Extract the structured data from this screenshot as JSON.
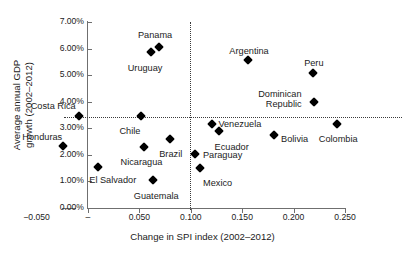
{
  "chart_data": {
    "type": "scatter",
    "title": "",
    "xlabel": "Change in SPI index (2002–2012)",
    "ylabel_line1": "Average annual GDP",
    "ylabel_line2": "growth (2002–2012)",
    "xlim": [
      -0.05,
      0.25
    ],
    "ylim": [
      0.0,
      7.0
    ],
    "grid": false,
    "legend": "none",
    "marker_style": "filled-diamond",
    "marker_color": "#000000",
    "xticks": [
      {
        "value": -0.05,
        "label": "−0.050"
      },
      {
        "value": 0.0,
        "label": "–"
      },
      {
        "value": 0.05,
        "label": "0.050"
      },
      {
        "value": 0.1,
        "label": "0.100"
      },
      {
        "value": 0.15,
        "label": "0.150"
      },
      {
        "value": 0.2,
        "label": "0.200"
      },
      {
        "value": 0.25,
        "label": "0.250"
      }
    ],
    "yticks": [
      {
        "value": 0.0,
        "label": "0.00%"
      },
      {
        "value": 1.0,
        "label": "1.00%"
      },
      {
        "value": 2.0,
        "label": "2.00%"
      },
      {
        "value": 3.0,
        "label": "3.00%"
      },
      {
        "value": 4.0,
        "label": "4.00%"
      },
      {
        "value": 5.0,
        "label": "5.00%"
      },
      {
        "value": 6.0,
        "label": "6.00%"
      },
      {
        "value": 7.0,
        "label": "7.00%"
      }
    ],
    "reference_lines": [
      {
        "orientation": "horizontal",
        "value": 3.42,
        "style": "dotted"
      },
      {
        "orientation": "vertical",
        "value": 0.099,
        "style": "dotted"
      }
    ],
    "points": [
      {
        "label": "Honduras",
        "x": -0.024,
        "y": 2.33,
        "label_dx": -41,
        "label_dy": -14
      },
      {
        "label": "Costa Rica",
        "x": -0.009,
        "y": 3.46,
        "label_dx": -48,
        "label_dy": -15
      },
      {
        "label": "El Salvador",
        "x": 0.01,
        "y": 1.54,
        "label_dx": -9,
        "label_dy": 8
      },
      {
        "label": "Chile",
        "x": 0.052,
        "y": 3.46,
        "label_dx": -22,
        "label_dy": 10
      },
      {
        "label": "Nicaragua",
        "x": 0.054,
        "y": 2.3,
        "label_dx": -23,
        "label_dy": 10
      },
      {
        "label": "Uruguay",
        "x": 0.061,
        "y": 5.87,
        "label_dx": -23,
        "label_dy": 11
      },
      {
        "label": "Guatemala",
        "x": 0.063,
        "y": 1.05,
        "label_dx": -19,
        "label_dy": 11
      },
      {
        "label": "Panama",
        "x": 0.069,
        "y": 6.06,
        "label_dx": -21,
        "label_dy": -17
      },
      {
        "label": "Brazil",
        "x": 0.08,
        "y": 2.6,
        "label_dx": -11,
        "label_dy": 10
      },
      {
        "label": "Paraguay",
        "x": 0.104,
        "y": 2.03,
        "label_dx": 8,
        "label_dy": -4
      },
      {
        "label": "Mexico",
        "x": 0.109,
        "y": 1.51,
        "label_dx": 3,
        "label_dy": 10
      },
      {
        "label": "Venezuela",
        "x": 0.121,
        "y": 3.16,
        "label_dx": 6,
        "label_dy": -5
      },
      {
        "label": "Ecuador",
        "x": 0.127,
        "y": 2.9,
        "label_dx": -4,
        "label_dy": 11
      },
      {
        "label": "Argentina",
        "x": 0.156,
        "y": 5.57,
        "label_dx": -19,
        "label_dy": -14
      },
      {
        "label": "Bolivia",
        "x": 0.181,
        "y": 2.75,
        "label_dx": 7,
        "label_dy": -1
      },
      {
        "label": "Peru",
        "x": 0.219,
        "y": 5.08,
        "label_dx": -9,
        "label_dy": -15
      },
      {
        "label": "Dominican Republic",
        "x": 0.22,
        "y": 3.99,
        "label_dx": -56,
        "label_dy": -13,
        "label_lines": [
          "Dominican",
          "Republic"
        ]
      },
      {
        "label": "Colombia",
        "x": 0.242,
        "y": 3.16,
        "label_dx": -18,
        "label_dy": 10
      }
    ]
  }
}
